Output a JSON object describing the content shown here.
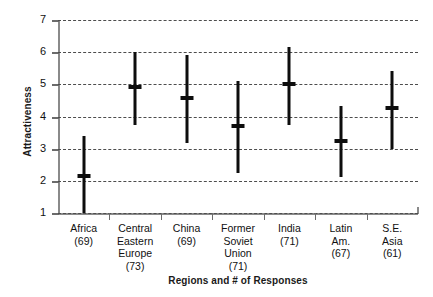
{
  "chart_data": {
    "type": "range",
    "title": "",
    "xlabel": "Regions and # of Responses",
    "ylabel": "Attractiveness",
    "ylim": [
      1,
      7
    ],
    "yticks": [
      1,
      2,
      3,
      4,
      5,
      6,
      7
    ],
    "ytick_labels": [
      "1",
      "2",
      "3",
      "4",
      "5",
      "6",
      "7"
    ],
    "grid": "horizontal-dashed",
    "legend": "none",
    "categories": [
      "Africa",
      "Central Eastern Europe",
      "China",
      "Former Soviet Union",
      "India",
      "Latin Am.",
      "S.E. Asia"
    ],
    "category_labels": [
      {
        "name": "Africa",
        "n": "(69)",
        "lines": [
          "Africa"
        ]
      },
      {
        "name": "Central Eastern Europe",
        "n": "(73)",
        "lines": [
          "Central",
          "Eastern",
          "Europe"
        ]
      },
      {
        "name": "China",
        "n": "(69)",
        "lines": [
          "China"
        ]
      },
      {
        "name": "Former Soviet Union",
        "n": "(71)",
        "lines": [
          "Former",
          "Soviet",
          "Union"
        ]
      },
      {
        "name": "India",
        "n": "(71)",
        "lines": [
          "India"
        ]
      },
      {
        "name": "Latin Am.",
        "n": "(67)",
        "lines": [
          "Latin",
          "Am."
        ]
      },
      {
        "name": "S.E. Asia",
        "n": "(61)",
        "lines": [
          "S.E.",
          "Asia"
        ]
      }
    ],
    "responses": [
      69,
      73,
      69,
      71,
      71,
      67,
      61
    ],
    "series": [
      {
        "name": "min",
        "values": [
          1.0,
          3.75,
          3.18,
          2.25,
          3.75,
          2.13,
          3.0
        ]
      },
      {
        "name": "mean",
        "values": [
          2.15,
          4.92,
          4.57,
          3.72,
          5.0,
          3.25,
          4.25
        ]
      },
      {
        "name": "max",
        "values": [
          3.4,
          6.0,
          5.92,
          5.1,
          6.15,
          4.32,
          5.43
        ]
      }
    ],
    "colors": {
      "mark": "#0d0d0d",
      "grid": "#4d4d4d",
      "axis": "#8a8a8a",
      "background": "#ffffff"
    }
  },
  "labels": {
    "cat_0_line_0": "Africa",
    "cat_0_n": "(69)",
    "cat_1_line_0": "Central",
    "cat_1_line_1": "Eastern",
    "cat_1_line_2": "Europe",
    "cat_1_n": "(73)",
    "cat_2_line_0": "China",
    "cat_2_n": "(69)",
    "cat_3_line_0": "Former",
    "cat_3_line_1": "Soviet",
    "cat_3_line_2": "Union",
    "cat_3_n": "(71)",
    "cat_4_line_0": "India",
    "cat_4_n": "(71)",
    "cat_5_line_0": "Latin",
    "cat_5_line_1": "Am.",
    "cat_5_n": "(67)",
    "cat_6_line_0": "S.E.",
    "cat_6_line_1": "Asia",
    "cat_6_n": "(61)"
  }
}
